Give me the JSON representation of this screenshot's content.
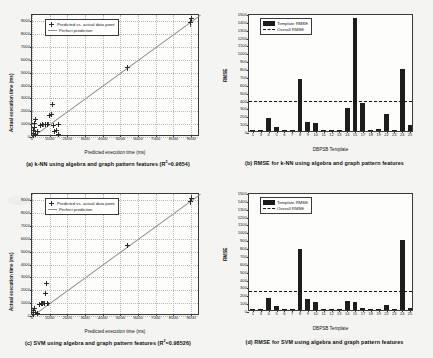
{
  "figure": {
    "background_color": "#f4f4f2",
    "panels": [
      "a",
      "b",
      "c",
      "d"
    ]
  },
  "chart_data": [
    {
      "id": "a",
      "type": "scatter",
      "title": "",
      "caption": "(a) k-NN using algebra and graph pattern features (R2=0.9654)",
      "caption_prefix": "(a) k-NN using algebra and graph pattern features (R",
      "caption_sup": "2",
      "caption_suffix": "=0.9654)",
      "r2": 0.9654,
      "xlabel": "Predicted execution time (ms)",
      "ylabel": "Actual execution time (ms)",
      "xlim": [
        0,
        9500
      ],
      "ylim": [
        0,
        9500
      ],
      "xticks": [
        0,
        1000,
        2000,
        3000,
        4000,
        5000,
        6000,
        7000,
        8000,
        9000
      ],
      "yticks": [
        0,
        1000,
        2000,
        3000,
        4000,
        5000,
        6000,
        7000,
        8000,
        9000
      ],
      "grid": true,
      "legend_position": "upper-left",
      "legend": [
        "Predicted vs. actual data point",
        "Perfect prediction"
      ],
      "reference_line": "y = x",
      "points": [
        {
          "x": 60,
          "y": 120,
          "err": 90
        },
        {
          "x": 90,
          "y": 300,
          "err": 120
        },
        {
          "x": 110,
          "y": 520,
          "err": 150
        },
        {
          "x": 130,
          "y": 760,
          "err": 160
        },
        {
          "x": 150,
          "y": 1060,
          "err": 180
        },
        {
          "x": 170,
          "y": 1350,
          "err": 150
        },
        {
          "x": 200,
          "y": 200,
          "err": 90
        },
        {
          "x": 320,
          "y": 420,
          "err": 110
        },
        {
          "x": 480,
          "y": 900,
          "err": 170
        },
        {
          "x": 620,
          "y": 950,
          "err": 140
        },
        {
          "x": 760,
          "y": 980,
          "err": 150
        },
        {
          "x": 900,
          "y": 1000,
          "err": 160
        },
        {
          "x": 980,
          "y": 1700,
          "err": 180
        },
        {
          "x": 1080,
          "y": 1750,
          "err": 150
        },
        {
          "x": 1150,
          "y": 2500,
          "err": 200
        },
        {
          "x": 1200,
          "y": 900,
          "err": 150
        },
        {
          "x": 1250,
          "y": 420,
          "err": 130
        },
        {
          "x": 1400,
          "y": 480,
          "err": 120
        },
        {
          "x": 1500,
          "y": 1000,
          "err": 170
        },
        {
          "x": 1520,
          "y": 180,
          "err": 120
        },
        {
          "x": 5400,
          "y": 5400,
          "err": 230
        },
        {
          "x": 8950,
          "y": 8900,
          "err": 300
        },
        {
          "x": 9000,
          "y": 9200,
          "err": 260
        }
      ]
    },
    {
      "id": "b",
      "type": "bar",
      "caption": "(b) RMSE for k-NN using algebra and graph pattern features",
      "xlabel": "DBPSB Template",
      "ylabel": "RMSE",
      "ylim": [
        0,
        1500
      ],
      "yticks": [
        0,
        100,
        200,
        300,
        400,
        500,
        600,
        700,
        800,
        900,
        1000,
        1100,
        1200,
        1300,
        1400,
        1500
      ],
      "grid": false,
      "legend_position": "upper-left",
      "legend": [
        "Template RMSE",
        "Overall RMSE"
      ],
      "overall_rmse": 405,
      "categories": [
        "1",
        "3",
        "4",
        "5",
        "6",
        "7",
        "8",
        "9",
        "10",
        "11",
        "12",
        "13",
        "14",
        "15",
        "17",
        "18",
        "19",
        "22",
        "23",
        "24",
        "25"
      ],
      "values": [
        8,
        6,
        165,
        45,
        5,
        4,
        655,
        110,
        105,
        10,
        5,
        8,
        290,
        1440,
        355,
        6,
        30,
        215,
        18,
        790,
        75
      ]
    },
    {
      "id": "c",
      "type": "scatter",
      "caption": "(c) SVM using algebra and graph pattern features (R2=0.98526)",
      "caption_prefix": "(c) SVM using algebra and graph pattern features (R",
      "caption_sup": "2",
      "caption_suffix": "=0.98526)",
      "r2": 0.98526,
      "xlabel": "Predicted execution time (ms)",
      "ylabel": "Actual execution time (ms)",
      "xlim": [
        0,
        9500
      ],
      "ylim": [
        0,
        9500
      ],
      "xticks": [
        0,
        1000,
        2000,
        3000,
        4000,
        5000,
        6000,
        7000,
        8000,
        9000
      ],
      "yticks": [
        0,
        1000,
        2000,
        3000,
        4000,
        5000,
        6000,
        7000,
        8000,
        9000
      ],
      "grid": true,
      "legend_position": "upper-left",
      "legend": [
        "Predicted vs. actual data point",
        "Perfect prediction"
      ],
      "reference_line": "y = x",
      "points": [
        {
          "x": 60,
          "y": 110,
          "err": 80
        },
        {
          "x": 80,
          "y": 250,
          "err": 110
        },
        {
          "x": 100,
          "y": 420,
          "err": 130
        },
        {
          "x": 130,
          "y": 600,
          "err": 140
        },
        {
          "x": 170,
          "y": 300,
          "err": 110
        },
        {
          "x": 300,
          "y": 200,
          "err": 100
        },
        {
          "x": 420,
          "y": 900,
          "err": 170
        },
        {
          "x": 520,
          "y": 950,
          "err": 150
        },
        {
          "x": 620,
          "y": 1000,
          "err": 150
        },
        {
          "x": 700,
          "y": 980,
          "err": 140
        },
        {
          "x": 760,
          "y": 1750,
          "err": 180
        },
        {
          "x": 800,
          "y": 2500,
          "err": 200
        },
        {
          "x": 860,
          "y": 1000,
          "err": 150
        },
        {
          "x": 900,
          "y": 950,
          "err": 140
        },
        {
          "x": 5400,
          "y": 5500,
          "err": 220
        },
        {
          "x": 8950,
          "y": 8900,
          "err": 290
        },
        {
          "x": 9000,
          "y": 9150,
          "err": 250
        }
      ]
    },
    {
      "id": "d",
      "type": "bar",
      "caption": "(d) RMSE for SVM using algebra and graph pattern features",
      "xlabel": "DBPSB Template",
      "ylabel": "RMSE",
      "ylim": [
        0,
        1500
      ],
      "yticks": [
        0,
        100,
        200,
        300,
        400,
        500,
        600,
        700,
        800,
        900,
        1000,
        1100,
        1200,
        1300,
        1400,
        1500
      ],
      "grid": false,
      "legend_position": "upper-left",
      "legend": [
        "Template RMSE",
        "Overall RMSE"
      ],
      "overall_rmse": 270,
      "categories": [
        "1",
        "3",
        "4",
        "5",
        "6",
        "7",
        "8",
        "9",
        "10",
        "11",
        "12",
        "13",
        "14",
        "15",
        "17",
        "18",
        "19",
        "22",
        "23",
        "24",
        "25"
      ],
      "values": [
        6,
        5,
        150,
        45,
        4,
        4,
        775,
        135,
        100,
        12,
        5,
        6,
        115,
        105,
        25,
        5,
        4,
        70,
        6,
        890,
        20
      ]
    }
  ]
}
